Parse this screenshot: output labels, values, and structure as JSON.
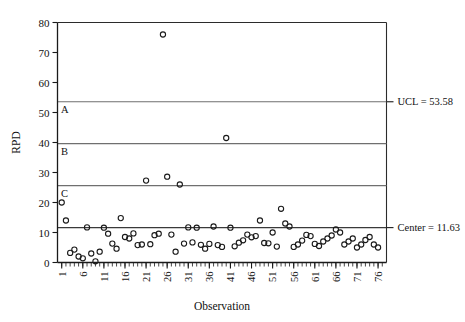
{
  "chart_data": {
    "type": "scatter",
    "title": "",
    "subtitle": "",
    "xlabel": "Observation",
    "ylabel": "RPD",
    "xlim": [
      0,
      78
    ],
    "ylim": [
      0,
      80
    ],
    "grid": false,
    "legend_position": "none",
    "y_ticks": [
      0,
      10,
      20,
      30,
      40,
      50,
      60,
      70,
      80
    ],
    "y_tick_labels": [
      "0",
      "10",
      "20",
      "30",
      "40",
      "50",
      "60",
      "70",
      "80"
    ],
    "x_ticks": [
      1,
      6,
      11,
      16,
      21,
      26,
      31,
      36,
      41,
      46,
      51,
      56,
      61,
      66,
      71,
      76
    ],
    "x_tick_labels": [
      "1",
      "6",
      "11",
      "16",
      "21",
      "26",
      "31",
      "36",
      "41",
      "46",
      "51",
      "56",
      "61",
      "66",
      "71",
      "76"
    ],
    "x_minor_tick_step": 1,
    "x_tick_label_rotation": -90,
    "reference_lines": [
      {
        "name": "ucl",
        "value": 53.58,
        "label": "UCL = 53.58",
        "zone_label": "A",
        "color": "#6f6f6f"
      },
      {
        "name": "zone_b_boundary",
        "value": 39.6,
        "label": "",
        "zone_label": "B",
        "color": "#6f6f6f"
      },
      {
        "name": "zone_c_boundary",
        "value": 25.6,
        "label": "",
        "zone_label": "C",
        "color": "#6f6f6f"
      },
      {
        "name": "center",
        "value": 11.63,
        "label": "Center = 11.63",
        "zone_label": "",
        "color": "#3a3a3a"
      }
    ],
    "x": [
      1,
      2,
      3,
      4,
      5,
      6,
      7,
      8,
      9,
      10,
      11,
      12,
      13,
      14,
      15,
      16,
      17,
      18,
      19,
      20,
      21,
      22,
      23,
      24,
      25,
      26,
      27,
      28,
      29,
      30,
      31,
      32,
      33,
      34,
      35,
      36,
      37,
      38,
      39,
      40,
      41,
      42,
      43,
      44,
      45,
      46,
      47,
      48,
      49,
      50,
      51,
      52,
      53,
      54,
      55,
      56,
      57,
      58,
      59,
      60,
      61,
      62,
      63,
      64,
      65,
      66,
      67,
      68,
      69,
      70,
      71,
      72,
      73,
      74,
      75,
      76
    ],
    "values": [
      20.0,
      14.0,
      3.2,
      4.3,
      2.0,
      1.4,
      11.7,
      3.0,
      0.4,
      3.6,
      11.6,
      9.6,
      6.3,
      4.6,
      14.8,
      8.5,
      8.0,
      9.7,
      5.8,
      6.0,
      27.3,
      6.1,
      9.1,
      9.6,
      76.0,
      28.6,
      9.3,
      3.6,
      26.0,
      6.3,
      11.7,
      6.7,
      11.6,
      5.9,
      4.6,
      6.2,
      12.0,
      5.8,
      5.2,
      41.5,
      11.6,
      5.4,
      6.6,
      7.4,
      9.3,
      8.4,
      8.8,
      14.0,
      6.5,
      6.4,
      10.0,
      5.3,
      17.9,
      13.0,
      12.0,
      5.2,
      6.0,
      7.3,
      9.2,
      8.8,
      6.2,
      5.5,
      7.0,
      8.0,
      9.0,
      11.0,
      10.0,
      6.0,
      7.0,
      8.0,
      5.0,
      6.0,
      7.5,
      8.5,
      6.0,
      5.0
    ]
  },
  "annotations": {
    "ucl_text": "UCL = 53.58",
    "center_text": "Center = 11.63",
    "zone_a": "A",
    "zone_b": "B",
    "zone_c": "C"
  },
  "axes": {
    "x_title": "Observation",
    "y_title": "RPD"
  }
}
